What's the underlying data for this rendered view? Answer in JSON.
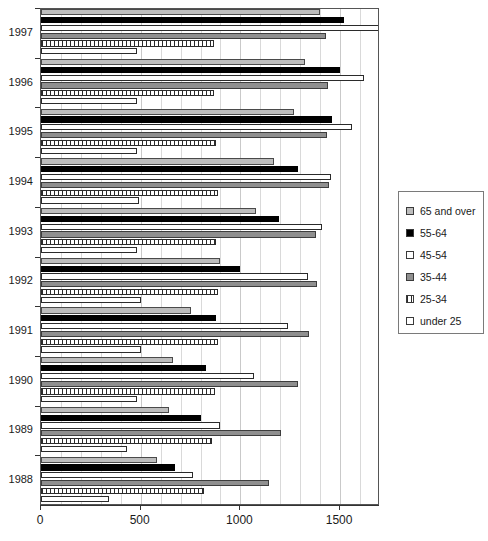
{
  "chart_data": {
    "type": "bar",
    "orientation": "horizontal",
    "title": "",
    "xlabel": "",
    "ylabel": "",
    "xlim": [
      0,
      1700
    ],
    "xticks": [
      0,
      500,
      1000,
      1500
    ],
    "xtick_labels": [
      "0",
      "500",
      "1000",
      "1500"
    ],
    "grid": true,
    "grid_interval": 100,
    "legend_position": "right",
    "categories": [
      "1988",
      "1989",
      "1990",
      "1991",
      "1992",
      "1993",
      "1994",
      "1995",
      "1996",
      "1997"
    ],
    "series": [
      {
        "name": "65 and over",
        "style": "light-gray",
        "values": [
          582,
          640,
          660,
          750,
          900,
          1080,
          1170,
          1270,
          1325,
          1400
        ]
      },
      {
        "name": "55-64",
        "style": "black",
        "values": [
          672,
          800,
          825,
          880,
          1000,
          1195,
          1290,
          1460,
          1500,
          1520
        ]
      },
      {
        "name": "45-54",
        "style": "white",
        "values": [
          760,
          900,
          1070,
          1240,
          1340,
          1410,
          1455,
          1560,
          1620,
          1720
        ]
      },
      {
        "name": "35-44",
        "style": "dark-gray",
        "values": [
          1145,
          1205,
          1290,
          1345,
          1385,
          1380,
          1445,
          1435,
          1440,
          1430
        ]
      },
      {
        "name": "25-34",
        "style": "hatched",
        "values": [
          818,
          860,
          875,
          890,
          890,
          880,
          890,
          880,
          870,
          870
        ]
      },
      {
        "name": "under 25",
        "style": "white",
        "values": [
          340,
          430,
          480,
          500,
          500,
          480,
          490,
          480,
          480,
          480
        ]
      }
    ]
  },
  "axis": {
    "x_tick_labels": [
      "0",
      "500",
      "1000",
      "1500"
    ],
    "y_tick_labels": [
      "1997",
      "1996",
      "1995",
      "1994",
      "1993",
      "1992",
      "1991",
      "1990",
      "1989",
      "1988"
    ]
  },
  "legend": {
    "items": [
      {
        "label": "65 and over",
        "style": "light-gray"
      },
      {
        "label": "55-64",
        "style": "black"
      },
      {
        "label": "45-54",
        "style": "white"
      },
      {
        "label": "35-44",
        "style": "dark-gray"
      },
      {
        "label": "25-34",
        "style": "hatched"
      },
      {
        "label": "under 25",
        "style": "white"
      }
    ]
  },
  "colors": {
    "light_gray": "#bdbdbd",
    "black": "#000000",
    "white": "#ffffff",
    "dark_gray": "#8f8f8f",
    "grid": "#d9d9d9",
    "axis": "#333333"
  }
}
